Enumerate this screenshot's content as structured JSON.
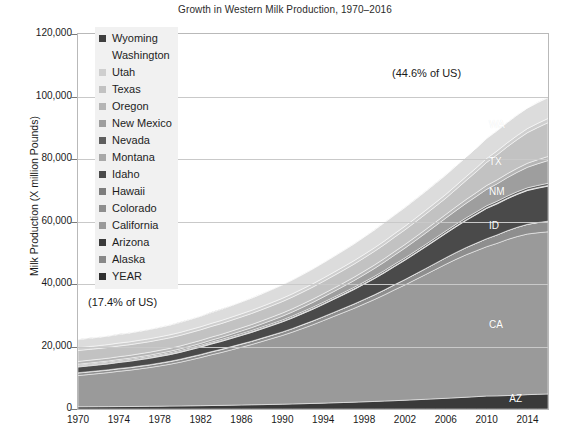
{
  "chart_data": {
    "type": "area",
    "stacked": true,
    "title": "Growth in Western Milk Production, 1970–2016",
    "xlabel": "",
    "ylabel": "Milk Production (X million Pounds)",
    "ylim": [
      0,
      120000
    ],
    "xlim": [
      1970,
      2016
    ],
    "yticks": [
      0,
      20000,
      40000,
      60000,
      80000,
      100000,
      120000
    ],
    "ytick_labels": [
      "0",
      "20,000",
      "40,000",
      "60,000",
      "80,000",
      "100,000",
      "120,000"
    ],
    "xticks": [
      1970,
      1974,
      1978,
      1982,
      1986,
      1990,
      1994,
      1998,
      2002,
      2006,
      2010,
      2014
    ],
    "xtick_labels": [
      "1970",
      "1974",
      "1978",
      "1982",
      "1986",
      "1990",
      "1994",
      "1998",
      "2002",
      "2006",
      "2010",
      "2014"
    ],
    "grid": true,
    "legend_position": "upper-left-inside",
    "annotations": [
      {
        "text": "(44.6% of US)",
        "x": 2008,
        "y": 108000
      },
      {
        "text": "(17.4% of US)",
        "x": 1973,
        "y": 36000
      }
    ],
    "series_labels": [
      {
        "text": "WA",
        "x": 2011,
        "y": 91000
      },
      {
        "text": "TX",
        "x": 2011,
        "y": 79000
      },
      {
        "text": "NM",
        "x": 2011,
        "y": 69500
      },
      {
        "text": "ID",
        "x": 2011,
        "y": 58500
      },
      {
        "text": "CA",
        "x": 2011,
        "y": 27000
      },
      {
        "text": "AZ",
        "x": 2013,
        "y": 3200
      }
    ],
    "x": [
      1970,
      1971,
      1972,
      1973,
      1974,
      1975,
      1976,
      1977,
      1978,
      1979,
      1980,
      1981,
      1982,
      1983,
      1984,
      1985,
      1986,
      1987,
      1988,
      1989,
      1990,
      1991,
      1992,
      1993,
      1994,
      1995,
      1996,
      1997,
      1998,
      1999,
      2000,
      2001,
      2002,
      2003,
      2004,
      2005,
      2006,
      2007,
      2008,
      2009,
      2010,
      2011,
      2012,
      2013,
      2014,
      2015,
      2016
    ],
    "series": [
      {
        "name": "Arizona",
        "code": "AZ",
        "color": "#3a3a3a",
        "values": [
          700,
          720,
          740,
          760,
          780,
          800,
          830,
          860,
          890,
          930,
          970,
          1010,
          1060,
          1110,
          1160,
          1220,
          1280,
          1340,
          1400,
          1470,
          1540,
          1620,
          1700,
          1790,
          1880,
          1980,
          2080,
          2190,
          2300,
          2420,
          2540,
          2670,
          2810,
          2950,
          3100,
          3260,
          3420,
          3590,
          3770,
          3960,
          4150,
          4200,
          4300,
          4400,
          4600,
          4700,
          4800
        ]
      },
      {
        "name": "California",
        "code": "CA",
        "color": "#9a9a9a",
        "values": [
          10000,
          10300,
          10600,
          10900,
          11300,
          11600,
          12000,
          12400,
          12900,
          13400,
          14000,
          14700,
          15400,
          16200,
          16900,
          17700,
          18500,
          19300,
          20200,
          21100,
          22000,
          23000,
          24100,
          25200,
          26400,
          27600,
          28800,
          30000,
          31300,
          32600,
          34000,
          35500,
          36900,
          38400,
          39900,
          41400,
          42900,
          44300,
          45600,
          46700,
          47800,
          48800,
          49900,
          50800,
          51400,
          51700,
          51900
        ]
      },
      {
        "name": "Colorado",
        "code": "CO",
        "color": "#8e8e8e",
        "values": [
          800,
          790,
          780,
          780,
          780,
          780,
          790,
          800,
          810,
          820,
          840,
          860,
          880,
          900,
          920,
          940,
          960,
          980,
          1000,
          1020,
          1050,
          1090,
          1130,
          1170,
          1210,
          1260,
          1310,
          1360,
          1420,
          1480,
          1550,
          1620,
          1700,
          1790,
          1880,
          1980,
          2080,
          2190,
          2300,
          2420,
          2550,
          2680,
          2820,
          2960,
          3100,
          3250,
          3400
        ]
      },
      {
        "name": "Hawaii",
        "code": "HI",
        "color": "#7d7d7d",
        "values": [
          130,
          130,
          130,
          130,
          130,
          130,
          130,
          130,
          130,
          130,
          130,
          130,
          125,
          120,
          115,
          110,
          105,
          100,
          95,
          90,
          85,
          80,
          75,
          70,
          65,
          60,
          55,
          50,
          45,
          40,
          38,
          36,
          34,
          32,
          30,
          28,
          26,
          24,
          22,
          20,
          18,
          16,
          15,
          14,
          13,
          12,
          11
        ]
      },
      {
        "name": "Idaho",
        "code": "ID",
        "color": "#4a4a4a",
        "values": [
          1800,
          1820,
          1840,
          1870,
          1900,
          1940,
          1980,
          2020,
          2070,
          2120,
          2180,
          2250,
          2320,
          2400,
          2490,
          2580,
          2680,
          2790,
          2910,
          3040,
          3180,
          3340,
          3510,
          3700,
          3900,
          4120,
          4350,
          4600,
          4870,
          5160,
          5470,
          5800,
          6150,
          6520,
          6910,
          7320,
          7750,
          8200,
          8670,
          9160,
          9670,
          9900,
          10200,
          10500,
          10800,
          11000,
          11200
        ]
      },
      {
        "name": "Montana",
        "code": "MT",
        "color": "#a8a8a8",
        "values": [
          330,
          325,
          320,
          315,
          310,
          305,
          300,
          295,
          290,
          285,
          280,
          278,
          276,
          274,
          272,
          270,
          268,
          266,
          264,
          262,
          260,
          258,
          256,
          254,
          252,
          250,
          248,
          246,
          244,
          242,
          240,
          238,
          236,
          234,
          232,
          230,
          228,
          226,
          224,
          222,
          220,
          218,
          216,
          214,
          212,
          210,
          208
        ]
      },
      {
        "name": "Nevada",
        "code": "NV",
        "color": "#5e5e5e",
        "values": [
          260,
          265,
          270,
          275,
          280,
          286,
          292,
          298,
          304,
          310,
          317,
          324,
          331,
          338,
          345,
          353,
          361,
          369,
          377,
          385,
          394,
          403,
          412,
          421,
          430,
          440,
          450,
          460,
          470,
          481,
          492,
          503,
          514,
          526,
          538,
          550,
          562,
          575,
          588,
          601,
          614,
          628,
          642,
          656,
          670,
          684,
          698
        ]
      },
      {
        "name": "New Mexico",
        "code": "NM",
        "color": "#9e9e9e",
        "values": [
          320,
          330,
          340,
          355,
          370,
          390,
          410,
          435,
          460,
          490,
          520,
          560,
          600,
          650,
          700,
          760,
          830,
          900,
          980,
          1070,
          1170,
          1280,
          1400,
          1530,
          1670,
          1820,
          1980,
          2150,
          2330,
          2520,
          2720,
          2930,
          3150,
          3380,
          3620,
          3870,
          4130,
          4400,
          4680,
          4970,
          5270,
          5580,
          5900,
          6230,
          6570,
          6920,
          7280
        ]
      },
      {
        "name": "Oregon",
        "code": "OR",
        "color": "#b5b5b5",
        "values": [
          880,
          885,
          890,
          895,
          900,
          906,
          912,
          918,
          924,
          930,
          937,
          944,
          951,
          958,
          965,
          973,
          981,
          989,
          997,
          1005,
          1014,
          1023,
          1032,
          1041,
          1050,
          1060,
          1070,
          1080,
          1090,
          1101,
          1112,
          1123,
          1134,
          1146,
          1158,
          1170,
          1182,
          1195,
          1208,
          1221,
          1234,
          1248,
          1262,
          1276,
          1290,
          1305,
          1320
        ]
      },
      {
        "name": "Texas",
        "code": "TX",
        "color": "#c2c2c2",
        "values": [
          3500,
          3480,
          3460,
          3440,
          3420,
          3410,
          3400,
          3390,
          3380,
          3380,
          3380,
          3390,
          3400,
          3420,
          3440,
          3470,
          3500,
          3540,
          3580,
          3630,
          3680,
          3740,
          3800,
          3870,
          3940,
          4020,
          4100,
          4190,
          4280,
          4380,
          4480,
          4590,
          4700,
          4820,
          4940,
          5070,
          5200,
          5600,
          6100,
          6700,
          7400,
          8000,
          8600,
          9200,
          9800,
          10300,
          10800
        ]
      },
      {
        "name": "Utah",
        "code": "UT",
        "color": "#cfcfcf",
        "values": [
          900,
          905,
          910,
          915,
          920,
          926,
          932,
          938,
          944,
          950,
          957,
          964,
          971,
          978,
          985,
          993,
          1001,
          1009,
          1017,
          1025,
          1034,
          1043,
          1052,
          1061,
          1070,
          1080,
          1090,
          1100,
          1110,
          1121,
          1132,
          1143,
          1154,
          1166,
          1178,
          1190,
          1202,
          1215,
          1228,
          1241,
          1254,
          1268,
          1282,
          1296,
          1310,
          1325,
          1340
        ]
      },
      {
        "name": "Washington",
        "code": "WA",
        "color": "#dcdcdc",
        "values": [
          2600,
          2640,
          2680,
          2730,
          2780,
          2840,
          2900,
          2970,
          3040,
          3120,
          3200,
          3290,
          3380,
          3480,
          3580,
          3690,
          3800,
          3920,
          4040,
          4170,
          4300,
          4440,
          4580,
          4730,
          4880,
          5040,
          5200,
          5370,
          5540,
          5720,
          5900,
          5950,
          6000,
          6050,
          6100,
          6150,
          6200,
          6250,
          6300,
          6350,
          6400,
          6450,
          6500,
          6550,
          6600,
          6650,
          6700
        ]
      },
      {
        "name": "Wyoming",
        "code": "WY",
        "color": "#3f3f3f",
        "values": [
          90,
          89,
          88,
          87,
          86,
          85,
          84,
          83,
          82,
          81,
          80,
          79,
          78,
          77,
          76,
          75,
          74,
          73,
          72,
          71,
          70,
          69,
          68,
          67,
          66,
          65,
          64,
          63,
          62,
          61,
          60,
          60,
          60,
          60,
          60,
          60,
          60,
          60,
          60,
          60,
          60,
          61,
          62,
          63,
          64,
          65,
          66
        ]
      },
      {
        "name": "Alaska",
        "code": "AK",
        "color": "#888888",
        "values": [
          20,
          20,
          20,
          20,
          20,
          19,
          19,
          19,
          18,
          18,
          18,
          17,
          17,
          16,
          16,
          15,
          15,
          14,
          14,
          13,
          13,
          12,
          12,
          11,
          11,
          10,
          10,
          9,
          9,
          8,
          8,
          7,
          7,
          6,
          6,
          5,
          5,
          4,
          4,
          3,
          3,
          3,
          3,
          2,
          2,
          2,
          2
        ]
      }
    ]
  },
  "legend": {
    "items": [
      {
        "label": "Wyoming",
        "color": "#3f3f3f"
      },
      {
        "label": "Washington",
        "color": "#f1f1f1"
      },
      {
        "label": "Utah",
        "color": "#cfcfcf"
      },
      {
        "label": "Texas",
        "color": "#c2c2c2"
      },
      {
        "label": "Oregon",
        "color": "#b5b5b5"
      },
      {
        "label": "New Mexico",
        "color": "#9e9e9e"
      },
      {
        "label": "Nevada",
        "color": "#5e5e5e"
      },
      {
        "label": "Montana",
        "color": "#a8a8a8"
      },
      {
        "label": "Idaho",
        "color": "#4a4a4a"
      },
      {
        "label": "Hawaii",
        "color": "#7d7d7d"
      },
      {
        "label": "Colorado",
        "color": "#8e8e8e"
      },
      {
        "label": "California",
        "color": "#9a9a9a"
      },
      {
        "label": "Arizona",
        "color": "#3a3a3a"
      },
      {
        "label": "Alaska",
        "color": "#888888"
      },
      {
        "label": "YEAR",
        "color": "#2f2f2f"
      }
    ]
  }
}
